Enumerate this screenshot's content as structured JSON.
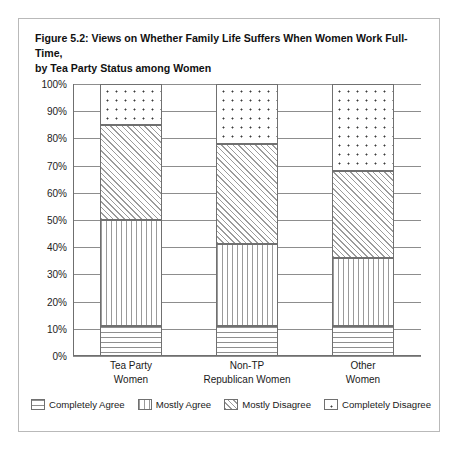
{
  "figure": {
    "title_line1": "Figure 5.2: Views on Whether Family Life Suffers When Women Work Full-Time,",
    "title_line2": "by Tea Party Status among Women"
  },
  "chart_data": {
    "type": "bar",
    "stacked": true,
    "stack_mode": "percent",
    "title": "Figure 5.2: Views on Whether Family Life Suffers When Women Work Full-Time, by Tea Party Status among Women",
    "xlabel": "",
    "ylabel": "",
    "ylim": [
      0,
      100
    ],
    "yticks": [
      "0%",
      "10%",
      "20%",
      "30%",
      "40%",
      "50%",
      "60%",
      "70%",
      "80%",
      "90%",
      "100%"
    ],
    "ytick_values": [
      0,
      10,
      20,
      30,
      40,
      50,
      60,
      70,
      80,
      90,
      100
    ],
    "grid": true,
    "legend_position": "bottom",
    "categories": [
      "Tea Party Women",
      "Non-TP Republican Women",
      "Other Women"
    ],
    "category_label_lines": [
      [
        "Tea Party",
        "Women"
      ],
      [
        "Non-TP",
        "Republican Women"
      ],
      [
        "Other",
        "Women"
      ]
    ],
    "series": [
      {
        "name": "Completely Agree",
        "pattern": "horizontal-lines",
        "values": [
          11,
          11,
          11
        ]
      },
      {
        "name": "Mostly Agree",
        "pattern": "vertical-lines",
        "values": [
          39,
          30,
          25
        ]
      },
      {
        "name": "Mostly Disagree",
        "pattern": "diagonal-hatch",
        "values": [
          35,
          37,
          32
        ]
      },
      {
        "name": "Completely Disagree",
        "pattern": "dots",
        "values": [
          15,
          22,
          32
        ]
      }
    ],
    "cumulative_tops": [
      [
        11,
        50,
        85,
        100
      ],
      [
        11,
        41,
        78,
        100
      ],
      [
        11,
        36,
        68,
        100
      ]
    ]
  },
  "legend": {
    "items": [
      {
        "label": "Completely Agree"
      },
      {
        "label": "Mostly Agree"
      },
      {
        "label": "Mostly Disagree"
      },
      {
        "label": "Completely Disagree"
      }
    ]
  }
}
